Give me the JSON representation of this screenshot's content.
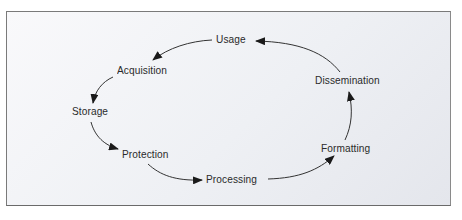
{
  "diagram": {
    "type": "cycle",
    "nodes": [
      {
        "id": "usage",
        "label": "Usage"
      },
      {
        "id": "acquisition",
        "label": "Acquisition"
      },
      {
        "id": "storage",
        "label": "Storage"
      },
      {
        "id": "protection",
        "label": "Protection"
      },
      {
        "id": "processing",
        "label": "Processing"
      },
      {
        "id": "formatting",
        "label": "Formatting"
      },
      {
        "id": "dissemination",
        "label": "Dissemination"
      }
    ],
    "edges": [
      {
        "from": "usage",
        "to": "acquisition"
      },
      {
        "from": "acquisition",
        "to": "storage"
      },
      {
        "from": "storage",
        "to": "protection"
      },
      {
        "from": "protection",
        "to": "processing"
      },
      {
        "from": "processing",
        "to": "formatting"
      },
      {
        "from": "formatting",
        "to": "dissemination"
      },
      {
        "from": "dissemination",
        "to": "usage"
      }
    ]
  }
}
